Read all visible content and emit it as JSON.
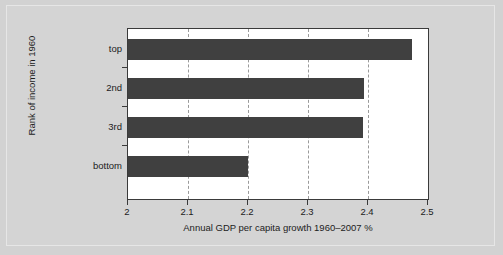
{
  "chart_data": {
    "type": "bar",
    "orientation": "horizontal",
    "title": "",
    "xlabel": "Annual GDP per capita growth 1960–2007 %",
    "ylabel": "Rank of income in 1960",
    "categories": [
      "top",
      "2nd",
      "3rd",
      "bottom"
    ],
    "values": [
      2.473,
      2.394,
      2.391,
      2.2
    ],
    "series": [
      {
        "name": "Annual GDP per capita growth 1960-2007 %",
        "values": [
          2.473,
          2.394,
          2.391,
          2.2
        ]
      }
    ],
    "xlim": [
      2,
      2.5
    ],
    "xticks": [
      2,
      2.1,
      2.2,
      2.3,
      2.4,
      2.5
    ],
    "xtick_labels": [
      "2",
      "2.1",
      "2.2",
      "2.3",
      "2.4",
      "2.5"
    ],
    "grid": "vertical-dashed",
    "legend": "none",
    "bar_color": "#404040",
    "plot_background": "#ffffff",
    "figure_background": "#d4d4d4"
  }
}
